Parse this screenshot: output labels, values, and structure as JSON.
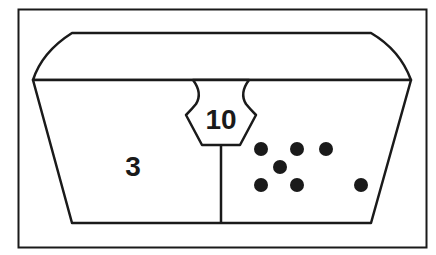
{
  "figure": {
    "colors": {
      "stroke": "#1a1a1a",
      "fill": "#ffffff",
      "dot": "#1a1a1a"
    }
  },
  "badge": {
    "value": "10"
  },
  "left_compartment": {
    "value": "3"
  },
  "right_compartment": {
    "dot_count": 7,
    "dots": [
      {
        "x": 261,
        "y": 149
      },
      {
        "x": 297,
        "y": 149
      },
      {
        "x": 326,
        "y": 149
      },
      {
        "x": 280,
        "y": 167
      },
      {
        "x": 261,
        "y": 185
      },
      {
        "x": 297,
        "y": 185
      },
      {
        "x": 361,
        "y": 185
      }
    ]
  }
}
